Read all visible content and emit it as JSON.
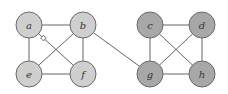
{
  "graph": {
    "colors": {
      "left_fill": "#cfcfcf",
      "right_fill": "#a8a8a8",
      "edge": "#555555",
      "node_stroke": "#6a6a6a"
    },
    "node_radius": 13,
    "nodes": [
      {
        "id": "a",
        "label": "a",
        "x": 29,
        "y": 25,
        "group": "left"
      },
      {
        "id": "b",
        "label": "b",
        "x": 83,
        "y": 25,
        "group": "left"
      },
      {
        "id": "e",
        "label": "e",
        "x": 29,
        "y": 74,
        "group": "left"
      },
      {
        "id": "f",
        "label": "f",
        "x": 83,
        "y": 74,
        "group": "left"
      },
      {
        "id": "c",
        "label": "c",
        "x": 150,
        "y": 25,
        "group": "right"
      },
      {
        "id": "d",
        "label": "d",
        "x": 202,
        "y": 25,
        "group": "right"
      },
      {
        "id": "g",
        "label": "g",
        "x": 150,
        "y": 74,
        "group": "right"
      },
      {
        "id": "h",
        "label": "h",
        "x": 202,
        "y": 74,
        "group": "right"
      }
    ],
    "edges": [
      {
        "from": "a",
        "to": "b"
      },
      {
        "from": "a",
        "to": "e"
      },
      {
        "from": "a",
        "to": "f",
        "marker": "square"
      },
      {
        "from": "b",
        "to": "e"
      },
      {
        "from": "b",
        "to": "f"
      },
      {
        "from": "e",
        "to": "f"
      },
      {
        "from": "b",
        "to": "g"
      },
      {
        "from": "c",
        "to": "d"
      },
      {
        "from": "c",
        "to": "g"
      },
      {
        "from": "c",
        "to": "h"
      },
      {
        "from": "d",
        "to": "g"
      },
      {
        "from": "d",
        "to": "h"
      },
      {
        "from": "g",
        "to": "h"
      }
    ]
  }
}
